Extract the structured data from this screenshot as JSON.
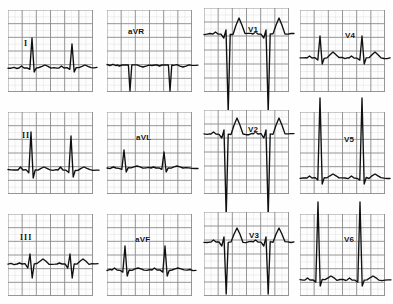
{
  "document": {
    "title": "12-Lead Electrocardiogram",
    "type": "ecg-strip-montage",
    "background_color": "#fefefe",
    "trace_color": "#111111",
    "grid_color": "#8a8a8a",
    "grid_minor_color": "#bdbdbd",
    "rows": 3,
    "columns": 4,
    "paper_speed": "25 mm/s",
    "grid_box_px": 14
  },
  "leads": [
    {
      "id": "lead-i",
      "label": "I",
      "label_style": "roman",
      "row": 0,
      "column": 0,
      "panel": {
        "x": 8,
        "y": 10,
        "w": 85,
        "h": 82
      },
      "label_pos": {
        "x": 16,
        "y": 30
      },
      "baseline_y": 58,
      "grid_cols": 6,
      "grid_rows": 6,
      "morphology": "small-r-waves-with-sharp-tall-R",
      "beats": [
        {
          "r_x": 24,
          "r_height": 30,
          "s_depth": 4,
          "t_height": 3,
          "p_height": 2
        },
        {
          "r_x": 64,
          "r_height": 24,
          "s_depth": 4,
          "t_height": 3,
          "p_height": 2
        }
      ]
    },
    {
      "id": "lead-avr",
      "label": "aVR",
      "label_style": "normal",
      "row": 0,
      "column": 1,
      "panel": {
        "x": 107,
        "y": 10,
        "w": 85,
        "h": 82
      },
      "label_pos": {
        "x": 128,
        "y": 28
      },
      "baseline_y": 55,
      "grid_cols": 6,
      "grid_rows": 6,
      "morphology": "deep-negative-QS-complexes",
      "beats": [
        {
          "r_x": 23,
          "r_height": 0,
          "s_depth": 26,
          "t_height": -2,
          "p_height": -1
        },
        {
          "r_x": 63,
          "r_height": 0,
          "s_depth": 26,
          "t_height": -2,
          "p_height": -1
        }
      ]
    },
    {
      "id": "lead-v1",
      "label": "V1",
      "label_style": "normal",
      "row": 0,
      "column": 2,
      "panel": {
        "x": 204,
        "y": 8,
        "w": 85,
        "h": 84
      },
      "label_pos": {
        "x": 44,
        "y": 18
      },
      "baseline_y": 26,
      "grid_cols": 6,
      "grid_rows": 6,
      "morphology": "rS-with-very-deep-S-and-tall-T",
      "beats": [
        {
          "r_x": 22,
          "r_height": 4,
          "s_depth": 78,
          "t_height": 16,
          "p_height": 2
        },
        {
          "r_x": 62,
          "r_height": 4,
          "s_depth": 78,
          "t_height": 16,
          "p_height": 2
        }
      ]
    },
    {
      "id": "lead-v4",
      "label": "V4",
      "label_style": "normal",
      "row": 0,
      "column": 3,
      "panel": {
        "x": 300,
        "y": 10,
        "w": 85,
        "h": 82
      },
      "label_pos": {
        "x": 45,
        "y": 22
      },
      "baseline_y": 48,
      "grid_cols": 6,
      "grid_rows": 6,
      "morphology": "qRs-with-upright-T",
      "beats": [
        {
          "r_x": 20,
          "r_height": 22,
          "s_depth": 6,
          "t_height": 6,
          "p_height": 2
        },
        {
          "r_x": 62,
          "r_height": 22,
          "s_depth": 6,
          "t_height": 6,
          "p_height": 2
        }
      ]
    },
    {
      "id": "lead-ii",
      "label": "II",
      "label_style": "roman",
      "row": 1,
      "column": 0,
      "panel": {
        "x": 8,
        "y": 112,
        "w": 85,
        "h": 82
      },
      "label_pos": {
        "x": 22,
        "y": 132
      },
      "baseline_y": 58,
      "grid_cols": 6,
      "grid_rows": 6,
      "morphology": "tall-narrow-R-waves",
      "beats": [
        {
          "r_x": 23,
          "r_height": 38,
          "s_depth": 8,
          "t_height": 3,
          "p_height": 3
        },
        {
          "r_x": 63,
          "r_height": 34,
          "s_depth": 7,
          "t_height": 3,
          "p_height": 3
        }
      ]
    },
    {
      "id": "lead-avl",
      "label": "aVL",
      "label_style": "normal",
      "row": 1,
      "column": 1,
      "panel": {
        "x": 107,
        "y": 112,
        "w": 85,
        "h": 82
      },
      "label_pos": {
        "x": 29,
        "y": 22
      },
      "baseline_y": 56,
      "grid_cols": 6,
      "grid_rows": 6,
      "morphology": "small-R-waves-flat-baseline",
      "beats": [
        {
          "r_x": 17,
          "r_height": 18,
          "s_depth": 4,
          "t_height": 2,
          "p_height": 1
        },
        {
          "r_x": 57,
          "r_height": 16,
          "s_depth": 4,
          "t_height": 2,
          "p_height": 1
        }
      ]
    },
    {
      "id": "lead-v2",
      "label": "V2",
      "label_style": "normal",
      "row": 1,
      "column": 2,
      "panel": {
        "x": 204,
        "y": 110,
        "w": 85,
        "h": 84
      },
      "label_pos": {
        "x": 44,
        "y": 16
      },
      "baseline_y": 24,
      "grid_cols": 6,
      "grid_rows": 6,
      "morphology": "rS-with-very-deep-S-and-tall-T",
      "beats": [
        {
          "r_x": 20,
          "r_height": 4,
          "s_depth": 82,
          "t_height": 16,
          "p_height": 2
        },
        {
          "r_x": 62,
          "r_height": 4,
          "s_depth": 82,
          "t_height": 16,
          "p_height": 2
        }
      ]
    },
    {
      "id": "lead-v5",
      "label": "V5",
      "label_style": "normal",
      "row": 1,
      "column": 3,
      "panel": {
        "x": 300,
        "y": 112,
        "w": 85,
        "h": 82
      },
      "label_pos": {
        "x": 44,
        "y": 24
      },
      "baseline_y": 66,
      "grid_cols": 6,
      "grid_rows": 6,
      "morphology": "very-tall-R-waves-off-scale",
      "beats": [
        {
          "r_x": 20,
          "r_height": 80,
          "s_depth": 6,
          "t_height": 4,
          "p_height": 2
        },
        {
          "r_x": 62,
          "r_height": 80,
          "s_depth": 6,
          "t_height": 4,
          "p_height": 2
        }
      ]
    },
    {
      "id": "lead-iii",
      "label": "III",
      "label_style": "roman",
      "row": 2,
      "column": 0,
      "panel": {
        "x": 8,
        "y": 214,
        "w": 85,
        "h": 82
      },
      "label_pos": {
        "x": 20,
        "y": 234
      },
      "baseline_y": 50,
      "grid_cols": 6,
      "grid_rows": 6,
      "morphology": "small-rS-complexes",
      "beats": [
        {
          "r_x": 22,
          "r_height": 10,
          "s_depth": 14,
          "t_height": 5,
          "p_height": 1
        },
        {
          "r_x": 62,
          "r_height": 10,
          "s_depth": 14,
          "t_height": 5,
          "p_height": 1
        }
      ]
    },
    {
      "id": "lead-avf",
      "label": "aVF",
      "label_style": "normal",
      "row": 2,
      "column": 1,
      "panel": {
        "x": 107,
        "y": 214,
        "w": 85,
        "h": 82
      },
      "label_pos": {
        "x": 28,
        "y": 22
      },
      "baseline_y": 56,
      "grid_cols": 6,
      "grid_rows": 6,
      "morphology": "moderate-R-waves",
      "beats": [
        {
          "r_x": 18,
          "r_height": 24,
          "s_depth": 6,
          "t_height": 2,
          "p_height": 2
        },
        {
          "r_x": 58,
          "r_height": 24,
          "s_depth": 6,
          "t_height": 2,
          "p_height": 2
        }
      ]
    },
    {
      "id": "lead-v3",
      "label": "V3",
      "label_style": "normal",
      "row": 2,
      "column": 2,
      "panel": {
        "x": 204,
        "y": 212,
        "w": 85,
        "h": 84
      },
      "label_pos": {
        "x": 45,
        "y": 20
      },
      "baseline_y": 30,
      "grid_cols": 6,
      "grid_rows": 6,
      "morphology": "rS-with-deep-S-and-tall-T",
      "beats": [
        {
          "r_x": 20,
          "r_height": 5,
          "s_depth": 52,
          "t_height": 14,
          "p_height": 2
        },
        {
          "r_x": 62,
          "r_height": 5,
          "s_depth": 52,
          "t_height": 14,
          "p_height": 2
        }
      ]
    },
    {
      "id": "lead-v6",
      "label": "V6",
      "label_style": "normal",
      "row": 2,
      "column": 3,
      "panel": {
        "x": 300,
        "y": 214,
        "w": 85,
        "h": 82
      },
      "label_pos": {
        "x": 44,
        "y": 22
      },
      "baseline_y": 66,
      "grid_cols": 6,
      "grid_rows": 6,
      "morphology": "very-tall-R-waves-off-scale",
      "beats": [
        {
          "r_x": 18,
          "r_height": 78,
          "s_depth": 6,
          "t_height": 4,
          "p_height": 2
        },
        {
          "r_x": 60,
          "r_height": 78,
          "s_depth": 6,
          "t_height": 4,
          "p_height": 2
        }
      ]
    }
  ]
}
